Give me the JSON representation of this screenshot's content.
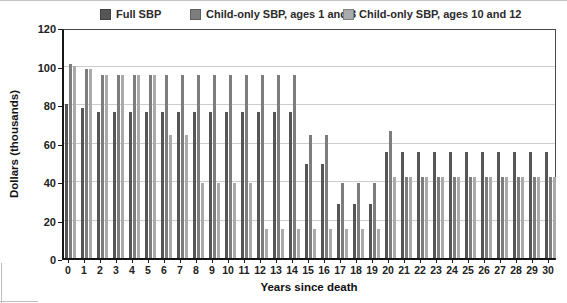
{
  "figure": {
    "x_axis_title": "Years since death",
    "y_axis_title": "Dollars (thousands)"
  },
  "legend": {
    "items": [
      {
        "label": "Full SBP",
        "color": "#565656"
      },
      {
        "label": "Child-only SBP, ages 1 and 3",
        "color": "#7d7d7d"
      },
      {
        "label": "Child-only SBP, ages 10 and 12",
        "color": "#aaaaaa"
      }
    ]
  },
  "chart_data": {
    "type": "bar",
    "title": "",
    "xlabel": "Years since death",
    "ylabel": "Dollars (thousands)",
    "ylim": [
      0,
      120
    ],
    "yticks": [
      0,
      20,
      40,
      60,
      80,
      100,
      120
    ],
    "grid": true,
    "gridline_values": [
      20,
      40,
      60,
      80,
      100
    ],
    "legend_position": "top",
    "categories": [
      0,
      1,
      2,
      3,
      4,
      5,
      6,
      7,
      8,
      9,
      10,
      11,
      12,
      13,
      14,
      15,
      16,
      17,
      18,
      19,
      20,
      21,
      22,
      23,
      24,
      25,
      26,
      27,
      28,
      29,
      30
    ],
    "series": [
      {
        "name": "Full SBP",
        "color": "#565656",
        "values": [
          80,
          78,
          76,
          76,
          76,
          76,
          76,
          76,
          76,
          76,
          76,
          76,
          76,
          76,
          76,
          49,
          49,
          28,
          28,
          28,
          55,
          55,
          55,
          55,
          55,
          55,
          55,
          55,
          55,
          55,
          55
        ]
      },
      {
        "name": "Child-only SBP, ages 1 and 3",
        "color": "#7d7d7d",
        "values": [
          101,
          98,
          95,
          95,
          95,
          95,
          95,
          95,
          95,
          95,
          95,
          95,
          95,
          95,
          95,
          64,
          64,
          39,
          39,
          39,
          66,
          42,
          42,
          42,
          42,
          42,
          42,
          42,
          42,
          42,
          42
        ]
      },
      {
        "name": "Child-only SBP, ages 10 and 12",
        "color": "#aaaaaa",
        "values": [
          100,
          98,
          95,
          95,
          95,
          95,
          64,
          64,
          39,
          39,
          39,
          39,
          15,
          15,
          15,
          15,
          15,
          15,
          15,
          15,
          42,
          42,
          42,
          42,
          42,
          42,
          42,
          42,
          42,
          42,
          42
        ]
      }
    ]
  }
}
